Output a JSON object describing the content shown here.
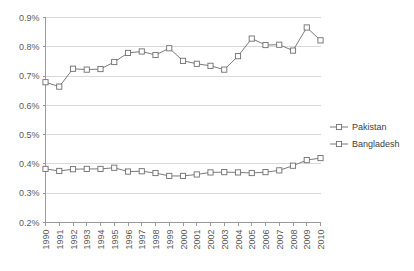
{
  "chart_data": {
    "type": "line",
    "title": "",
    "subtitle": "",
    "xlabel": "",
    "ylabel": "",
    "grid": true,
    "legend_position": "right",
    "x": [
      1990,
      1991,
      1992,
      1993,
      1994,
      1995,
      1996,
      1997,
      1998,
      1999,
      2000,
      2001,
      2002,
      2003,
      2004,
      2005,
      2006,
      2007,
      2008,
      2009,
      2010
    ],
    "categories": [
      "1990",
      "1991",
      "1992",
      "1993",
      "1994",
      "1995",
      "1996",
      "1997",
      "1998",
      "1999",
      "2000",
      "2001",
      "2002",
      "2003",
      "2004",
      "2005",
      "2006",
      "2007",
      "2008",
      "2009",
      "2010"
    ],
    "xtick_labels": [
      "1990",
      "1991",
      "1992",
      "1993",
      "1994",
      "1995",
      "1996",
      "1997",
      "1998",
      "1999",
      "2000",
      "2001",
      "2002",
      "2003",
      "2004",
      "2005",
      "2006",
      "2007",
      "2008",
      "2009",
      "2010"
    ],
    "ytick_labels": [
      "0.2%",
      "0.3%",
      "0.4%",
      "0.5%",
      "0.6%",
      "0.7%",
      "0.8%",
      "0.9%"
    ],
    "ytick_values": [
      0.2,
      0.3,
      0.4,
      0.5,
      0.6,
      0.7,
      0.8,
      0.9
    ],
    "ylim": [
      0.2,
      0.9
    ],
    "units": "percent",
    "series": [
      {
        "name": "Pakistan",
        "color": "#808080",
        "marker": "square-open",
        "values": [
          0.679,
          0.664,
          0.725,
          0.722,
          0.724,
          0.748,
          0.779,
          0.784,
          0.772,
          0.795,
          0.752,
          0.742,
          0.735,
          0.722,
          0.768,
          0.828,
          0.806,
          0.807,
          0.787,
          0.866,
          0.822
        ]
      },
      {
        "name": "Bangladesh",
        "color": "#808080",
        "marker": "square-open",
        "values": [
          0.383,
          0.376,
          0.382,
          0.383,
          0.383,
          0.387,
          0.374,
          0.375,
          0.369,
          0.359,
          0.359,
          0.364,
          0.371,
          0.372,
          0.371,
          0.369,
          0.372,
          0.378,
          0.394,
          0.413,
          0.42
        ]
      }
    ]
  },
  "legend": {
    "items": [
      {
        "label": "Pakistan"
      },
      {
        "label": "Bangladesh"
      }
    ]
  },
  "colors": {
    "line": "#7a7a7a",
    "marker_fill": "#ffffff",
    "marker_stroke": "#6e6e6e",
    "grid": "#d9d9d9",
    "axis": "#9a9a9a",
    "text": "#595959",
    "background": "#ffffff"
  }
}
